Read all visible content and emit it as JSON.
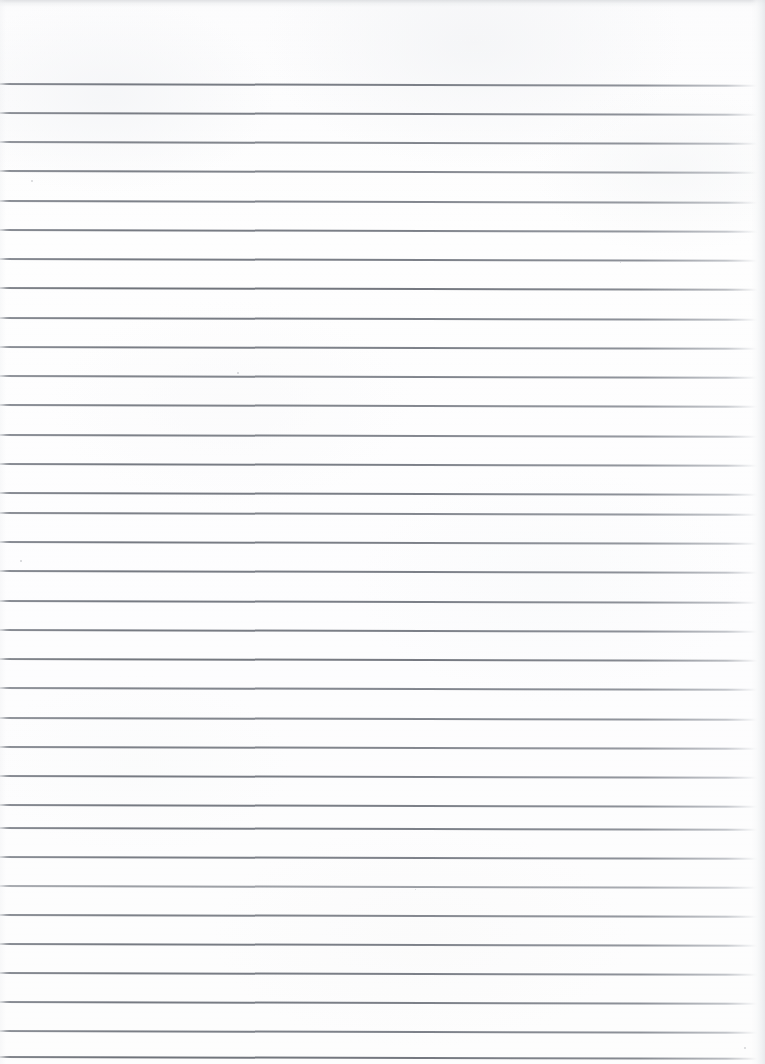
{
  "document": {
    "kind": "scanned-lined-notebook-page",
    "page_width": 765,
    "page_height": 1064,
    "body_text": "",
    "handwriting": "",
    "visible_text": ""
  },
  "paper": {
    "background_color": "#fdfdfd",
    "edge_shadow_color": "#d6d8db",
    "right_edge_color": "#e4e6e9"
  },
  "ruling": {
    "line_color": "#7c8088",
    "line_thickness_px": 1.6,
    "spacing_px": 29.2,
    "first_line_y": 83,
    "line_count": 34,
    "start_x": 0,
    "end_x": 757,
    "tilt_deg": 0.14,
    "lines": [
      {
        "y": 83,
        "weight": "normal"
      },
      {
        "y": 112,
        "weight": "normal"
      },
      {
        "y": 141,
        "weight": "normal"
      },
      {
        "y": 170,
        "weight": "normal"
      },
      {
        "y": 200,
        "weight": "normal"
      },
      {
        "y": 229,
        "weight": "normal"
      },
      {
        "y": 258,
        "weight": "normal"
      },
      {
        "y": 287,
        "weight": "heavy"
      },
      {
        "y": 317,
        "weight": "normal"
      },
      {
        "y": 346,
        "weight": "normal"
      },
      {
        "y": 375,
        "weight": "normal"
      },
      {
        "y": 404,
        "weight": "normal"
      },
      {
        "y": 434,
        "weight": "normal"
      },
      {
        "y": 463,
        "weight": "normal"
      },
      {
        "y": 492,
        "weight": "normal"
      },
      {
        "y": 512,
        "weight": "normal"
      },
      {
        "y": 541,
        "weight": "normal"
      },
      {
        "y": 570,
        "weight": "normal"
      },
      {
        "y": 600,
        "weight": "normal"
      },
      {
        "y": 629,
        "weight": "normal"
      },
      {
        "y": 658,
        "weight": "heavy"
      },
      {
        "y": 687,
        "weight": "normal"
      },
      {
        "y": 717,
        "weight": "normal"
      },
      {
        "y": 746,
        "weight": "normal"
      },
      {
        "y": 775,
        "weight": "normal"
      },
      {
        "y": 804,
        "weight": "normal"
      },
      {
        "y": 827,
        "weight": "normal"
      },
      {
        "y": 856,
        "weight": "normal"
      },
      {
        "y": 885,
        "weight": "light"
      },
      {
        "y": 914,
        "weight": "normal"
      },
      {
        "y": 943,
        "weight": "normal"
      },
      {
        "y": 972,
        "weight": "normal"
      },
      {
        "y": 1001,
        "weight": "normal"
      },
      {
        "y": 1030,
        "weight": "normal"
      },
      {
        "y": 1056,
        "weight": "heavy"
      }
    ]
  },
  "specks": [
    {
      "x": 31,
      "y": 180,
      "size": 2.0
    },
    {
      "x": 20,
      "y": 560,
      "size": 1.6
    },
    {
      "x": 744,
      "y": 1047,
      "size": 1.8
    },
    {
      "x": 415,
      "y": 889,
      "size": 1.4
    },
    {
      "x": 237,
      "y": 372,
      "size": 1.5
    },
    {
      "x": 620,
      "y": 262,
      "size": 1.3
    }
  ]
}
